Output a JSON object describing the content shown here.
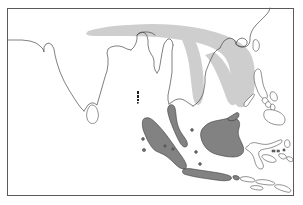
{
  "figure": {
    "name": "distribution-map",
    "type": "range-map",
    "region": "South and Southeast Asia",
    "title": "",
    "caption": "",
    "background_color": "#ffffff",
    "frame": {
      "color": "#5a5a5a",
      "x": 7,
      "y": 8,
      "width": 287,
      "height": 188
    }
  },
  "legend": {
    "visible": false,
    "entries": [
      {
        "label": "",
        "color": "#cecece",
        "name": "light-gray-range"
      },
      {
        "label": "",
        "color": "#828282",
        "name": "dark-gray-range"
      }
    ]
  },
  "colors": {
    "light_range": "#cecece",
    "dark_range": "#828282",
    "coastline": "#4a4a4a",
    "frame": "#5a5a5a",
    "land": "#ffffff"
  },
  "features": {
    "light_range_label": "Himalayan-Indochina band",
    "dark_range_label": "Sundaland islands",
    "landmasses": [
      "Indian subcontinent",
      "Sri Lanka",
      "Myanmar",
      "Thailand",
      "Laos",
      "Vietnam",
      "Cambodia",
      "Malay Peninsula",
      "Sumatra",
      "Borneo",
      "Java",
      "Sulawesi",
      "Philippines",
      "Andaman and Nicobar Islands",
      "Lesser Sunda Islands",
      "Hainan"
    ]
  },
  "chart_data": {
    "type": "map",
    "title": "",
    "xlabel": "",
    "ylabel": "",
    "grid": false,
    "legend_position": "none",
    "series": [
      {
        "name": "light-gray-range",
        "color": "#cecece",
        "areas": [
          "Himalayan foothills",
          "Northern Myanmar",
          "Laos",
          "Vietnam",
          "Cambodia"
        ]
      },
      {
        "name": "dark-gray-range",
        "color": "#828282",
        "areas": [
          "Malay Peninsula",
          "Sumatra",
          "Borneo",
          "Java"
        ]
      }
    ]
  }
}
